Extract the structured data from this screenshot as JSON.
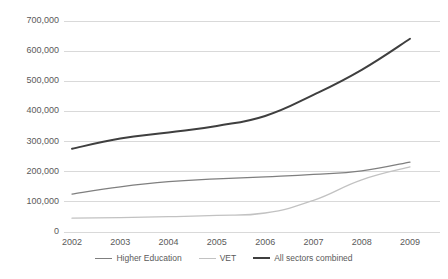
{
  "chart_data": {
    "type": "line",
    "title": "",
    "xlabel": "",
    "ylabel": "",
    "categories": [
      "2002",
      "2003",
      "2004",
      "2005",
      "2006",
      "2007",
      "2008",
      "2009"
    ],
    "x": [
      2002,
      2003,
      2004,
      2005,
      2006,
      2007,
      2008,
      2009
    ],
    "ylim": [
      0,
      700000
    ],
    "ytick_labels": [
      "0",
      "100,000",
      "200,000",
      "300,000",
      "400,000",
      "500,000",
      "600,000",
      "700,000"
    ],
    "ytick_values": [
      0,
      100000,
      200000,
      300000,
      400000,
      500000,
      600000,
      700000
    ],
    "grid": true,
    "legend_position": "bottom",
    "series": [
      {
        "name": "Higher Education",
        "color": "#7f7f7f",
        "width": 1.3,
        "values": [
          126000,
          150000,
          167000,
          176000,
          183000,
          191000,
          203000,
          232000
        ]
      },
      {
        "name": "VET",
        "color": "#c2c2c2",
        "width": 1.3,
        "values": [
          46000,
          48000,
          51000,
          55000,
          63000,
          105000,
          173000,
          216000
        ]
      },
      {
        "name": "All sectors combined",
        "color": "#3f3f3f",
        "width": 2.0,
        "values": [
          276000,
          310000,
          330000,
          352000,
          385000,
          455000,
          538000,
          641000
        ]
      }
    ]
  }
}
